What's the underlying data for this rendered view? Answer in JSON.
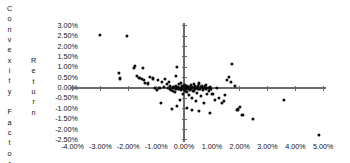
{
  "chart_data": {
    "type": "scatter",
    "title": "",
    "ylabel": "Convexity Factor",
    "ylabel_secondary": "Return",
    "xlabel": "",
    "xlim": [
      -4.0,
      5.0
    ],
    "ylim": [
      -2.5,
      3.0
    ],
    "grid": false,
    "legend": null,
    "x_unit": "%",
    "y_unit": "%",
    "x_ticks": [
      "-4.00%",
      "-3.00%",
      "-2.00%",
      "-1.00%",
      "0.00%",
      "1.00%",
      "2.00%",
      "3.00%",
      "4.00%",
      "5.00%"
    ],
    "x_tick_values": [
      -4.0,
      -3.0,
      -2.0,
      -1.0,
      0.0,
      1.0,
      2.0,
      3.0,
      4.0,
      5.0
    ],
    "y_ticks": [
      "3.00%",
      "2.50%",
      "2.00%",
      "1.50%",
      "1.00%",
      "0.50%",
      "0.00%",
      "-0.50%",
      "-1.00%",
      "-1.50%",
      "-2.00%",
      "-2.50%"
    ],
    "y_tick_values": [
      3.0,
      2.5,
      2.0,
      1.5,
      1.0,
      0.5,
      0.0,
      -0.5,
      -1.0,
      -1.5,
      -2.0,
      -2.5
    ],
    "axis_color": "#6b6b6b",
    "marker_color": "#0d0d0d",
    "n_points": 106,
    "points": [
      [
        -3.02,
        2.55
      ],
      [
        -2.05,
        2.5
      ],
      [
        -2.32,
        0.72
      ],
      [
        -2.3,
        0.46
      ],
      [
        -1.8,
        0.95
      ],
      [
        -1.75,
        1.05
      ],
      [
        -1.68,
        0.6
      ],
      [
        -1.6,
        0.5
      ],
      [
        -1.52,
        0.42
      ],
      [
        -1.48,
        0.96
      ],
      [
        -1.45,
        0.4
      ],
      [
        -1.4,
        0.26
      ],
      [
        -1.3,
        0.22
      ],
      [
        -1.22,
        0.55
      ],
      [
        -1.12,
        0.46
      ],
      [
        -1.05,
        0.02
      ],
      [
        -0.98,
        -0.08
      ],
      [
        -0.92,
        0.38
      ],
      [
        -0.88,
        0.02
      ],
      [
        -0.82,
        -0.7
      ],
      [
        -0.78,
        0.3
      ],
      [
        -0.72,
        0.06
      ],
      [
        -0.7,
        0.44
      ],
      [
        -0.62,
        0.2
      ],
      [
        -0.58,
        0.02
      ],
      [
        -0.55,
        0.3
      ],
      [
        -0.52,
        -0.04
      ],
      [
        -0.5,
        0.08
      ],
      [
        -0.46,
        -0.1
      ],
      [
        -0.44,
        0.02
      ],
      [
        -0.4,
        -0.14
      ],
      [
        -0.38,
        0.04
      ],
      [
        -0.35,
        0.0
      ],
      [
        -0.32,
        -0.18
      ],
      [
        -0.3,
        0.1
      ],
      [
        -0.28,
        -0.02
      ],
      [
        -0.26,
        -0.88
      ],
      [
        -0.22,
        0.06
      ],
      [
        -0.2,
        -0.04
      ],
      [
        -0.18,
        0.18
      ],
      [
        -0.16,
        -0.56
      ],
      [
        -0.14,
        0.02
      ],
      [
        -0.12,
        -0.1
      ],
      [
        -0.1,
        0.24
      ],
      [
        -0.08,
        -0.02
      ],
      [
        -0.06,
        0.08
      ],
      [
        -0.05,
        -0.3
      ],
      [
        -0.04,
        0.0
      ],
      [
        -0.02,
        0.12
      ],
      [
        -0.26,
        1.02
      ],
      [
        -0.3,
        0.58
      ],
      [
        0.0,
        -0.02
      ],
      [
        0.02,
        0.06
      ],
      [
        0.04,
        -0.12
      ],
      [
        0.05,
        0.16
      ],
      [
        0.06,
        -0.04
      ],
      [
        0.08,
        0.02
      ],
      [
        0.1,
        -0.2
      ],
      [
        0.12,
        0.1
      ],
      [
        0.14,
        -0.02
      ],
      [
        0.16,
        0.06
      ],
      [
        0.18,
        -0.34
      ],
      [
        0.2,
        0.0
      ],
      [
        0.22,
        -0.08
      ],
      [
        0.24,
        0.14
      ],
      [
        0.26,
        -0.02
      ],
      [
        0.28,
        0.06
      ],
      [
        0.3,
        -0.46
      ],
      [
        0.32,
        0.02
      ],
      [
        0.34,
        -0.14
      ],
      [
        0.36,
        0.18
      ],
      [
        0.38,
        -0.02
      ],
      [
        0.4,
        0.08
      ],
      [
        0.42,
        -0.62
      ],
      [
        0.45,
        0.02
      ],
      [
        0.48,
        -0.24
      ],
      [
        0.5,
        0.1
      ],
      [
        0.52,
        -0.06
      ],
      [
        0.55,
        0.22
      ],
      [
        0.58,
        -0.02
      ],
      [
        0.6,
        0.04
      ],
      [
        0.62,
        -0.4
      ],
      [
        0.65,
        0.12
      ],
      [
        0.68,
        -0.1
      ],
      [
        0.7,
        0.02
      ],
      [
        0.72,
        -0.72
      ],
      [
        0.75,
        0.08
      ],
      [
        0.78,
        -0.02
      ],
      [
        0.8,
        0.16
      ],
      [
        0.82,
        -0.28
      ],
      [
        0.85,
        0.02
      ],
      [
        0.88,
        -0.16
      ],
      [
        0.92,
        0.06
      ],
      [
        0.95,
        -0.04
      ],
      [
        0.3,
        -1.05
      ],
      [
        0.55,
        -1.12
      ],
      [
        0.12,
        -0.96
      ],
      [
        -0.42,
        -1.02
      ],
      [
        0.92,
        -1.22
      ],
      [
        1.02,
        -0.3
      ],
      [
        1.1,
        -0.56
      ],
      [
        1.18,
        0.02
      ],
      [
        1.25,
        -0.48
      ],
      [
        1.35,
        -0.7
      ],
      [
        1.42,
        -0.62
      ],
      [
        1.48,
        -0.34
      ],
      [
        1.55,
        0.4
      ],
      [
        1.62,
        0.52
      ],
      [
        1.7,
        0.28
      ],
      [
        1.72,
        1.18
      ],
      [
        1.82,
        0.12
      ],
      [
        1.92,
        -1.06
      ],
      [
        1.95,
        -1.0
      ],
      [
        2.02,
        -0.92
      ],
      [
        2.1,
        -1.32
      ],
      [
        2.48,
        -1.48
      ],
      [
        3.58,
        -0.58
      ],
      [
        4.85,
        -2.28
      ]
    ]
  },
  "labels": {
    "y_title_outer_letters": [
      "C",
      "o",
      "n",
      "v",
      "e",
      "x",
      "i",
      "t",
      "y",
      "",
      "F",
      "a",
      "c",
      "t",
      "o",
      "r"
    ],
    "y_title_inner_letters": [
      "R",
      "e",
      "t",
      "u",
      "r",
      "n"
    ]
  }
}
